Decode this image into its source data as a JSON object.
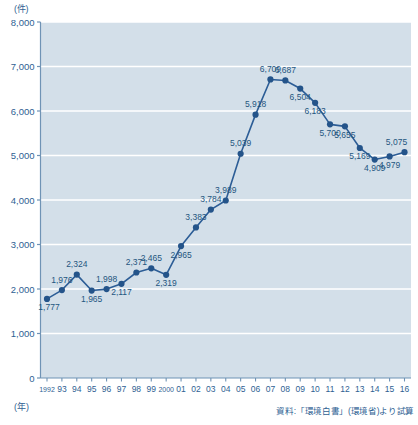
{
  "chart_data": {
    "type": "line",
    "title": "",
    "unit_label": "(件)",
    "xlabel": "(年)",
    "ylabel": "",
    "ylim": [
      0,
      8000
    ],
    "grid": true,
    "legend": "none",
    "source_note": "資料:「環境白書」(環境省)より試算",
    "ytick_labels": [
      "8,000",
      "7,000",
      "6,000",
      "5,000",
      "4,000",
      "3,000",
      "2,000",
      "1,000",
      "0"
    ],
    "ytick_values": [
      8000,
      7000,
      6000,
      5000,
      4000,
      3000,
      2000,
      1000,
      0
    ],
    "categories": [
      "1992",
      "93",
      "94",
      "95",
      "96",
      "97",
      "98",
      "99",
      "2000",
      "01",
      "02",
      "03",
      "04",
      "05",
      "06",
      "07",
      "08",
      "09",
      "10",
      "11",
      "12",
      "13",
      "14",
      "15",
      "16"
    ],
    "values": [
      1777,
      1976,
      2324,
      1965,
      1998,
      2117,
      2371,
      2465,
      2319,
      2965,
      3383,
      3784,
      3989,
      5039,
      5918,
      6709,
      6687,
      6504,
      6183,
      5700,
      5655,
      5169,
      4909,
      4979,
      5075
    ],
    "data_labels": [
      "1,777",
      "1,976",
      "2,324",
      "1,965",
      "1,998",
      "2,117",
      "2,371",
      "2,465",
      "2,319",
      "2,965",
      "3,383",
      "3,784",
      "3,989",
      "5,039",
      "5,918",
      "6,709",
      "6,687",
      "6,504",
      "6,183",
      "5,700",
      "5,655",
      "5,169",
      "4,909",
      "4,979",
      "5,075"
    ],
    "label_positions": [
      "below",
      "above",
      "above",
      "below",
      "above",
      "below",
      "above",
      "above",
      "below",
      "below",
      "above",
      "above",
      "above",
      "above",
      "above",
      "above",
      "above",
      "below",
      "below",
      "below",
      "below",
      "below",
      "below",
      "below",
      "above"
    ],
    "colors": {
      "line": "#2c5d96",
      "marker": "#24548a",
      "plot_background": "#d3dfe9",
      "grid": "#ffffff",
      "axis": "#6f93b5",
      "text": "#2f5f93"
    }
  }
}
